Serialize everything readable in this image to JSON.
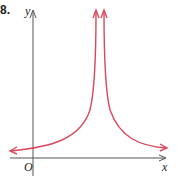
{
  "problem_number": "8.",
  "axes": {
    "y_label": "y",
    "x_label": "x",
    "origin_label": "O",
    "axis_color": "#555555"
  },
  "curve": {
    "description": "Graph symmetric about a vertical asymptote right of the y-axis; branches rise steeply toward the asymptote and approach the x-axis at both ends",
    "color": "#d9485a"
  }
}
